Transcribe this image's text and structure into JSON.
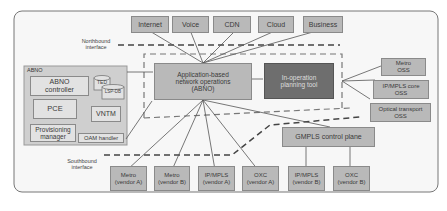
{
  "services": [
    "Internet",
    "Voice",
    "CDN",
    "Cloud",
    "Business"
  ],
  "labels": {
    "northbound": "Northbound\ninterface",
    "southbound": "Southbound\ninterface",
    "abno_group": "ABNO"
  },
  "abno_components": {
    "controller": "ABNO\ncontroller",
    "ted": "TED",
    "lsp_db": "LSP-DB",
    "pce": "PCE",
    "vntm": "VNTM",
    "provisioning": "Provisioning\nmanager",
    "oam": "OAM handler"
  },
  "center": {
    "abno": "Application-based\nnetwork operations\n(ABNO)",
    "planning_tool": "In-operation\nplanning tool"
  },
  "oss": [
    "Metro\nOSS",
    "IP/MPLS core\nOSS",
    "Optical transport\nOSS"
  ],
  "gmpls": "GMPLS control plane",
  "devices": [
    "Metro\n(vendor A)",
    "Metro\n(vendor B)",
    "IP/MPLS\n(vendor A)",
    "OXC\n(vendor A)",
    "IP/MPLS\n(vendor B)",
    "OXC\n(vendor B)"
  ],
  "colors": {
    "box_gray": "#b9b9b9",
    "box_light": "#e2e2e2",
    "box_dark": "#6e6e6e",
    "abno_panel": "#cfcfcf",
    "background": "#f7f7f7"
  }
}
